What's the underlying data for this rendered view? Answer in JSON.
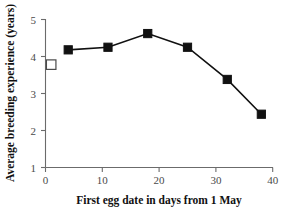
{
  "chart_data": {
    "type": "line",
    "title": "",
    "xlabel": "First egg date in days from 1 May",
    "ylabel": "Average breeding experience (years)",
    "xlim": [
      0,
      40
    ],
    "ylim": [
      1,
      5
    ],
    "xticks": [
      0,
      10,
      20,
      30,
      40
    ],
    "yticks": [
      1,
      2,
      3,
      4,
      5
    ],
    "xtick_labels": [
      "0",
      "10",
      "20",
      "30",
      "40"
    ],
    "ytick_labels": [
      "1",
      "2",
      "3",
      "4",
      "5"
    ],
    "grid": false,
    "legend": false,
    "series": [
      {
        "name": "Average breeding experience",
        "marker": "filled-square",
        "color": "#111111",
        "x": [
          4,
          11,
          18,
          25,
          32,
          38
        ],
        "values": [
          4.18,
          4.25,
          4.62,
          4.25,
          3.38,
          2.44
        ]
      },
      {
        "name": "Reference point",
        "marker": "open-square",
        "color": "#ffffff",
        "x": [
          1
        ],
        "values": [
          3.78
        ]
      }
    ]
  },
  "axes": {
    "x_title": "First egg date in days from 1 May",
    "y_title": "Average breeding experience (years)",
    "x_tick_0": "0",
    "x_tick_1": "10",
    "x_tick_2": "20",
    "x_tick_3": "30",
    "x_tick_4": "40",
    "y_tick_0": "5",
    "y_tick_1": "4",
    "y_tick_2": "3",
    "y_tick_3": "2",
    "y_tick_4": "1"
  },
  "colors": {
    "marker_fill": "#111111",
    "axis": "#6b6b6b",
    "text": "#111111",
    "background": "#ffffff"
  }
}
